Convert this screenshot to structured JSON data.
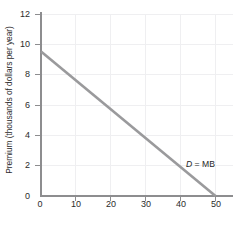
{
  "chart_data": {
    "type": "line",
    "title": "",
    "xlabel": "Quantity (millions of families insured)",
    "ylabel": "Premium (thousands of dollars per year)",
    "xlim": [
      0,
      55
    ],
    "ylim": [
      0,
      12.6
    ],
    "xticks": [
      0,
      10,
      20,
      30,
      40,
      50
    ],
    "yticks": [
      0,
      2,
      4,
      6,
      8,
      10,
      12
    ],
    "grid": true,
    "legend": "none",
    "series": [
      {
        "name": "D = MB",
        "color": "#9a9a9c",
        "x": [
          0,
          50
        ],
        "y": [
          10,
          0
        ],
        "points": [
          {
            "x": 0,
            "y": 10
          },
          {
            "x": 10,
            "y": 8
          },
          {
            "x": 20,
            "y": 6
          },
          {
            "x": 30,
            "y": 4
          },
          {
            "x": 40,
            "y": 2
          },
          {
            "x": 50,
            "y": 0
          }
        ]
      }
    ],
    "annotations": [
      {
        "text": "D = MB",
        "text_parts": {
          "symbol": "D",
          "equals": "=",
          "value": "MB"
        },
        "x": 45,
        "y": 1.9
      }
    ]
  },
  "axes": {
    "y": {
      "title": "Premium (thousands of dollars per year)",
      "tick_labels": [
        "0",
        "2",
        "4",
        "6",
        "8",
        "10",
        "12"
      ]
    },
    "x": {
      "title": "Quantity (millions of families insured)",
      "tick_labels": [
        "0",
        "10",
        "20",
        "30",
        "40",
        "50"
      ]
    }
  },
  "colors": {
    "line": "#9a9a9c",
    "axis": "#8d8d8f",
    "grid": "#efeff1",
    "text": "#2b2b2b",
    "background": "#ffffff"
  }
}
